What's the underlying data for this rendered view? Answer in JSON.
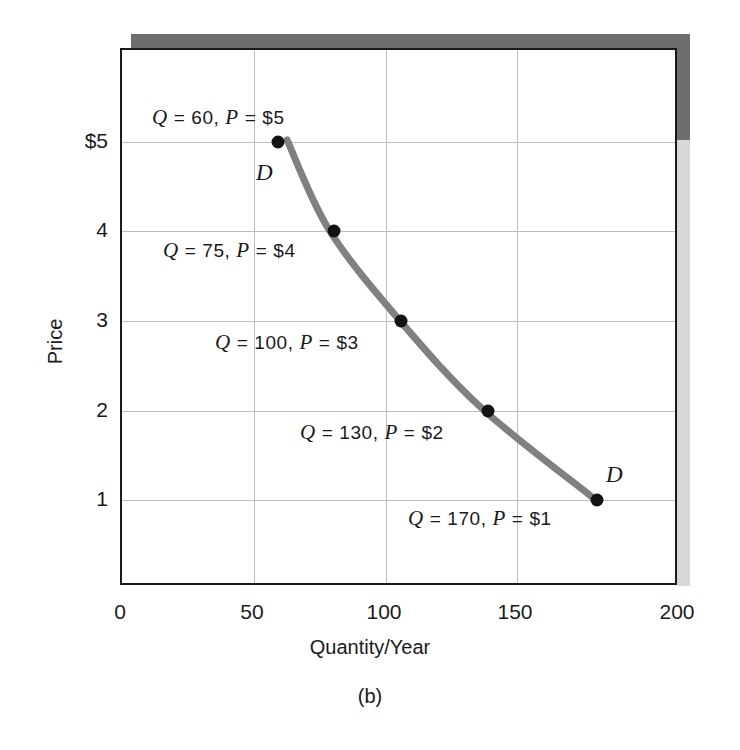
{
  "chart_data": {
    "type": "line",
    "title": "",
    "subtitle": "",
    "xlabel": "Quantity/Year",
    "ylabel": "Price",
    "panel_caption": "(b)",
    "xlim": [
      0,
      200
    ],
    "ylim": [
      0,
      5.5
    ],
    "grid": true,
    "legend": null,
    "xticks": [
      "0",
      "50",
      "100",
      "150",
      "200"
    ],
    "xtick_values": [
      0,
      50,
      100,
      150,
      200
    ],
    "yticks": [
      "1",
      "2",
      "3",
      "4",
      "$5"
    ],
    "ytick_values": [
      1,
      2,
      3,
      4,
      5
    ],
    "series": [
      {
        "name": "D",
        "curve_label": "D",
        "color": "#808080",
        "marker_color": "#121212",
        "x": [
          60,
          75,
          100,
          130,
          170
        ],
        "y": [
          5,
          4,
          3,
          2,
          1
        ]
      }
    ],
    "points": [
      {
        "q": 60,
        "p": 5,
        "label": "Q = 60, P = $5",
        "q_text": "60",
        "p_text": "$5"
      },
      {
        "q": 75,
        "p": 4,
        "label": "Q = 75, P = $4",
        "q_text": "75",
        "p_text": "$4"
      },
      {
        "q": 100,
        "p": 3,
        "label": "Q = 100, P = $3",
        "q_text": "100",
        "p_text": "$3"
      },
      {
        "q": 130,
        "p": 2,
        "label": "Q = 130, P = $2",
        "q_text": "130",
        "p_text": "$2"
      },
      {
        "q": 170,
        "p": 1,
        "label": "Q = 170, P = $1",
        "q_text": "170",
        "p_text": "$1"
      }
    ],
    "annotations": [
      {
        "id": "annot-q60",
        "q_symbol": "Q",
        "eq1": "=",
        "q_value": "60,",
        "p_symbol": "P",
        "eq2": "=",
        "p_value": "$5"
      },
      {
        "id": "annot-q75",
        "q_symbol": "Q",
        "eq1": "=",
        "q_value": "75,",
        "p_symbol": "P",
        "eq2": "=",
        "p_value": "$4"
      },
      {
        "id": "annot-q100",
        "q_symbol": "Q",
        "eq1": "=",
        "q_value": "100,",
        "p_symbol": "P",
        "eq2": "=",
        "p_value": "$3"
      },
      {
        "id": "annot-q130",
        "q_symbol": "Q",
        "eq1": "=",
        "q_value": "130,",
        "p_symbol": "P",
        "eq2": "=",
        "p_value": "$2"
      },
      {
        "id": "annot-q170",
        "q_symbol": "Q",
        "eq1": "=",
        "q_value": "170,",
        "p_symbol": "P",
        "eq2": "=",
        "p_value": "$1"
      }
    ],
    "curve_labels": [
      {
        "id": "d-label-top",
        "text": "D"
      },
      {
        "id": "d-label-bottom",
        "text": "D"
      }
    ],
    "colors": {
      "curve": "#808080",
      "marker": "#121212",
      "frame": "#1a1a1a",
      "grid": "#bdbdbd",
      "shadow": "#6e6e6e",
      "background": "#ffffff"
    }
  }
}
